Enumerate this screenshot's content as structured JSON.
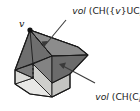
{
  "figure": {
    "background_color": "#ffffff",
    "vertex": {
      "name": "v",
      "label": "v"
    },
    "annotations": {
      "top": {
        "prefix": "vol",
        "body_open": " (CH({",
        "var": "v",
        "body_mid": "}UC",
        "sub": "i",
        "body_close": "))",
        "full_text": "vol (CH({v}UC_i))"
      },
      "bottom": {
        "prefix": "vol",
        "body_open": " (CH(C",
        "sub": "i",
        "body_close": "))",
        "full_text": "vol (CH(C_i))"
      }
    },
    "colors": {
      "face_dark": "#6f6f6f",
      "face_mid": "#8a8a8a",
      "face_light_gray": "#9a9a9a",
      "face_base_light": "#e8e8e6",
      "face_base_shadow": "#cfcfcc",
      "outline": "#1a1a1a",
      "hidden_edge": "#1a1a1a",
      "arrow": "#3a3a3a",
      "vertex_dot": "#111111",
      "text": "#1a1a1a"
    }
  }
}
